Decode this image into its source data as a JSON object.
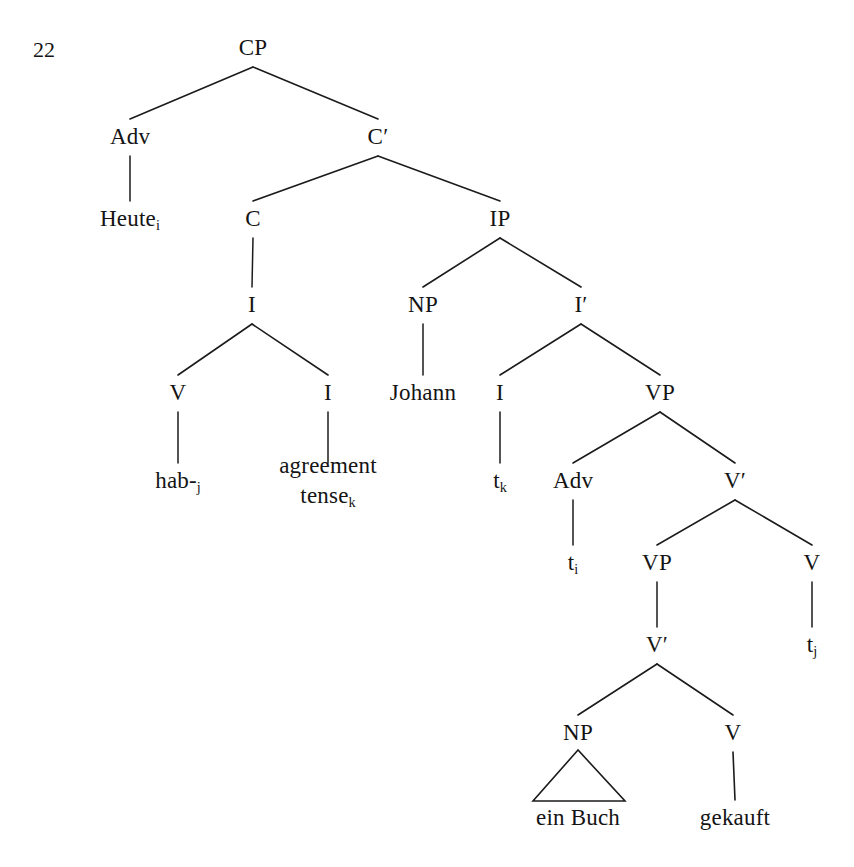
{
  "figure": {
    "number": "22",
    "caption": "",
    "language": "German",
    "sentence": "Heute hab- Johann ein Buch gekauft",
    "ink_color": "#141414",
    "background_color": "#ffffff"
  },
  "tree": {
    "nodes": [
      {
        "id": "CP",
        "label": "CP",
        "x": 253,
        "y": 48,
        "type": "category"
      },
      {
        "id": "Adv1",
        "label": "Adv",
        "x": 130,
        "y": 137,
        "type": "category"
      },
      {
        "id": "Cbar",
        "label": "C′",
        "x": 378,
        "y": 137,
        "type": "category"
      },
      {
        "id": "Heute",
        "label": "Heute",
        "sub": "i",
        "x": 130,
        "y": 219,
        "type": "terminal"
      },
      {
        "id": "C",
        "label": "C",
        "x": 253,
        "y": 219,
        "type": "category"
      },
      {
        "id": "IP",
        "label": "IP",
        "x": 500,
        "y": 219,
        "type": "category"
      },
      {
        "id": "I_under_C",
        "label": "I",
        "x": 252,
        "y": 305,
        "type": "category"
      },
      {
        "id": "NP1",
        "label": "NP",
        "x": 423,
        "y": 305,
        "type": "category"
      },
      {
        "id": "Ibar",
        "label": "I′",
        "x": 581,
        "y": 305,
        "type": "category"
      },
      {
        "id": "V1",
        "label": "V",
        "x": 178,
        "y": 393,
        "type": "category"
      },
      {
        "id": "I_right",
        "label": "I",
        "x": 328,
        "y": 393,
        "type": "category"
      },
      {
        "id": "Johann",
        "label": "Johann",
        "x": 423,
        "y": 393,
        "type": "terminal"
      },
      {
        "id": "I_infl",
        "label": "I",
        "x": 500,
        "y": 393,
        "type": "category"
      },
      {
        "id": "VP1",
        "label": "VP",
        "x": 660,
        "y": 393,
        "type": "category"
      },
      {
        "id": "hab",
        "label": "hab-",
        "sub": "j",
        "x": 178,
        "y": 481,
        "type": "terminal"
      },
      {
        "id": "agrtense",
        "label": "agreement",
        "label2": "tense",
        "sub2": "k",
        "x": 328,
        "y": 481,
        "type": "terminal"
      },
      {
        "id": "tk",
        "label": "t",
        "sub": "k",
        "x": 500,
        "y": 481,
        "type": "trace"
      },
      {
        "id": "Adv2",
        "label": "Adv",
        "x": 573,
        "y": 481,
        "type": "category"
      },
      {
        "id": "Vbar1",
        "label": "V′",
        "x": 735,
        "y": 481,
        "type": "category"
      },
      {
        "id": "ti",
        "label": "t",
        "sub": "i",
        "x": 573,
        "y": 563,
        "type": "trace"
      },
      {
        "id": "VP2",
        "label": "VP",
        "x": 657,
        "y": 563,
        "type": "category"
      },
      {
        "id": "V2",
        "label": "V",
        "x": 812,
        "y": 563,
        "type": "category"
      },
      {
        "id": "Vbar2",
        "label": "V′",
        "x": 657,
        "y": 645,
        "type": "category"
      },
      {
        "id": "tj",
        "label": "t",
        "sub": "j",
        "x": 812,
        "y": 645,
        "type": "trace"
      },
      {
        "id": "NP2",
        "label": "NP",
        "x": 578,
        "y": 733,
        "type": "category"
      },
      {
        "id": "V3",
        "label": "V",
        "x": 733,
        "y": 733,
        "type": "category"
      },
      {
        "id": "einbuch",
        "label": "ein Buch",
        "x": 578,
        "y": 818,
        "type": "terminal"
      },
      {
        "id": "gekauft",
        "label": "gekauft",
        "x": 735,
        "y": 818,
        "type": "terminal"
      }
    ],
    "branches": [
      {
        "from": "CP",
        "to": "Adv1"
      },
      {
        "from": "CP",
        "to": "Cbar"
      },
      {
        "from": "Adv1",
        "to": "Heute"
      },
      {
        "from": "Cbar",
        "to": "C"
      },
      {
        "from": "Cbar",
        "to": "IP"
      },
      {
        "from": "C",
        "to": "I_under_C"
      },
      {
        "from": "IP",
        "to": "NP1"
      },
      {
        "from": "IP",
        "to": "Ibar"
      },
      {
        "from": "I_under_C",
        "to": "V1"
      },
      {
        "from": "I_under_C",
        "to": "I_right"
      },
      {
        "from": "NP1",
        "to": "Johann"
      },
      {
        "from": "Ibar",
        "to": "I_infl"
      },
      {
        "from": "Ibar",
        "to": "VP1"
      },
      {
        "from": "V1",
        "to": "hab"
      },
      {
        "from": "I_right",
        "to": "agrtense"
      },
      {
        "from": "I_infl",
        "to": "tk"
      },
      {
        "from": "VP1",
        "to": "Adv2"
      },
      {
        "from": "VP1",
        "to": "Vbar1"
      },
      {
        "from": "Adv2",
        "to": "ti"
      },
      {
        "from": "Vbar1",
        "to": "VP2"
      },
      {
        "from": "Vbar1",
        "to": "V2"
      },
      {
        "from": "VP2",
        "to": "Vbar2"
      },
      {
        "from": "V2",
        "to": "tj"
      },
      {
        "from": "Vbar2",
        "to": "NP2"
      },
      {
        "from": "Vbar2",
        "to": "V3"
      },
      {
        "from": "V3",
        "to": "gekauft"
      }
    ],
    "triangles": [
      {
        "id": "np-triangle",
        "parent": "NP2",
        "apex_x": 578,
        "apex_y": 750,
        "left_x": 533,
        "right_x": 625,
        "base_y": 801
      }
    ]
  }
}
